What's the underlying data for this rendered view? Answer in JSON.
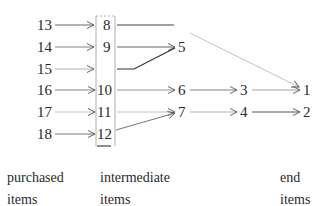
{
  "diagram": {
    "title": "",
    "nodes": [
      {
        "id": "13",
        "label": "13",
        "x": 37,
        "y": 30
      },
      {
        "id": "14",
        "label": "14",
        "x": 37,
        "y": 52
      },
      {
        "id": "15",
        "label": "15",
        "x": 37,
        "y": 74
      },
      {
        "id": "16",
        "label": "16",
        "x": 37,
        "y": 95
      },
      {
        "id": "17",
        "label": "17",
        "x": 37,
        "y": 117
      },
      {
        "id": "18",
        "label": "18",
        "x": 37,
        "y": 139
      },
      {
        "id": "8",
        "label": "8",
        "x": 103,
        "y": 30
      },
      {
        "id": "9",
        "label": "9",
        "x": 103,
        "y": 52
      },
      {
        "id": "10",
        "label": "10",
        "x": 97,
        "y": 95
      },
      {
        "id": "11",
        "label": "11",
        "x": 97,
        "y": 117
      },
      {
        "id": "12",
        "label": "12",
        "x": 97,
        "y": 139
      },
      {
        "id": "5",
        "label": "5",
        "x": 178,
        "y": 52
      },
      {
        "id": "6",
        "label": "6",
        "x": 178,
        "y": 95
      },
      {
        "id": "7",
        "label": "7",
        "x": 178,
        "y": 117
      },
      {
        "id": "3",
        "label": "3",
        "x": 240,
        "y": 95
      },
      {
        "id": "4",
        "label": "4",
        "x": 240,
        "y": 117
      },
      {
        "id": "1",
        "label": "1",
        "x": 303,
        "y": 95
      },
      {
        "id": "2",
        "label": "2",
        "x": 303,
        "y": 117
      }
    ],
    "edges": [
      {
        "from": "13",
        "to": "8"
      },
      {
        "from": "14",
        "to": "9"
      },
      {
        "from": "15",
        "to": "box"
      },
      {
        "from": "16",
        "to": "10"
      },
      {
        "from": "17",
        "to": "11"
      },
      {
        "from": "18",
        "to": "12"
      },
      {
        "from": "8",
        "to": "1"
      },
      {
        "from": "9",
        "to": "5"
      },
      {
        "from": "box",
        "to": "5"
      },
      {
        "from": "10",
        "to": "6"
      },
      {
        "from": "11",
        "to": "7"
      },
      {
        "from": "12",
        "to": "7"
      },
      {
        "from": "6",
        "to": "3"
      },
      {
        "from": "7",
        "to": "4"
      },
      {
        "from": "3",
        "to": "1"
      },
      {
        "from": "4",
        "to": "2"
      }
    ],
    "column_labels": [
      {
        "line1": "purchased",
        "line2": "items"
      },
      {
        "line1": "intermediate",
        "line2": "items"
      },
      {
        "line1": "end",
        "line2": "items"
      }
    ]
  }
}
